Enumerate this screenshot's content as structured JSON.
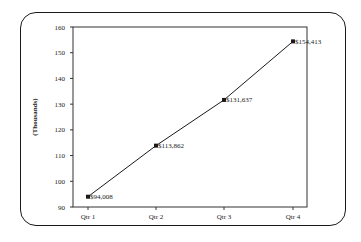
{
  "chart_data": {
    "type": "line",
    "title": "",
    "xlabel": "",
    "ylabel": "(Thousands)",
    "categories": [
      "Qtr 1",
      "Qtr 2",
      "Qtr 3",
      "Qtr 4"
    ],
    "series": [
      {
        "name": "Sales",
        "values": [
          94.008,
          113.862,
          131.637,
          154.413
        ],
        "labels": [
          "$94,008",
          "$113,862",
          "$131,637",
          "$154,413"
        ],
        "marker": "square",
        "color": "#1a1a1a"
      }
    ],
    "ylim": [
      90,
      160
    ],
    "yticks": [
      90,
      100,
      110,
      120,
      130,
      140,
      150,
      160
    ],
    "ytick_labels": [
      "90",
      "100",
      "110",
      "120",
      "130",
      "140",
      "150",
      "160"
    ],
    "grid": false,
    "legend": "none"
  },
  "frame": {
    "style": "rounded-border"
  }
}
